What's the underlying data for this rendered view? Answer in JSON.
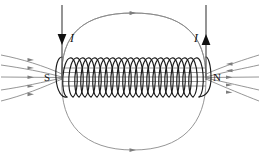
{
  "figure": {
    "name": "solenoid-magnetic-field-diagram",
    "background_color": "#ffffff"
  },
  "colors": {
    "field_line": "#8a8a8a",
    "coil_wire": "#1a1a1a",
    "lead_wire": "#5a5a5a",
    "arrow_head": "#111111",
    "label_text": "#111111"
  },
  "labels": {
    "south_pole": "S",
    "north_pole": "N",
    "current_left": "I",
    "current_right": "I"
  },
  "coil": {
    "turns": 10,
    "left_x": 62,
    "right_x": 205,
    "top_y": 57,
    "bottom_y": 97,
    "loop_width": 13
  },
  "leads": {
    "left": {
      "x": 62,
      "top_y": 5,
      "bottom_y": 80,
      "direction": "down",
      "arrow_y": 39
    },
    "right": {
      "x": 206,
      "top_y": 5,
      "bottom_y": 80,
      "direction": "up",
      "arrow_y": 37
    }
  },
  "field_lines": {
    "outer_loops": 2,
    "side_lines_left": 5,
    "side_lines_right": 5,
    "arrow_marker_count": 14,
    "direction_note": "field exits N (right) and enters S (left)"
  },
  "icons": {
    "arrow_down": "arrow-down-icon",
    "arrow_up": "arrow-up-icon",
    "field-arrow": "field-direction-arrow-icon"
  }
}
